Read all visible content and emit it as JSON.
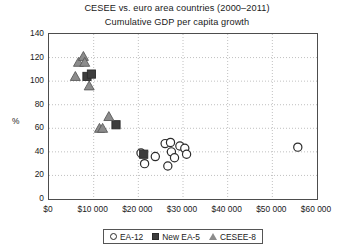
{
  "chart_data": {
    "type": "scatter",
    "title": "CESEE vs. euro area countries (2000–2011)",
    "subtitle": "Cumulative GDP per capita growth",
    "xlabel": "",
    "ylabel": "%",
    "xlim": [
      0,
      60000
    ],
    "ylim": [
      0,
      140
    ],
    "xticks": [
      0,
      10000,
      20000,
      30000,
      40000,
      50000,
      60000
    ],
    "xticklabels": [
      "$0",
      "$10 000",
      "$20 000",
      "$30 000",
      "$40 000",
      "$50 000",
      "$60 000"
    ],
    "yticks": [
      0,
      20,
      40,
      60,
      80,
      100,
      120,
      140
    ],
    "yticklabels": [
      "0",
      "20",
      "40",
      "60",
      "80",
      "100",
      "120",
      "140"
    ],
    "grid": "dotted-both-axes",
    "legend_position": "bottom-center",
    "series": [
      {
        "name": "EA-12",
        "marker": "open-circle",
        "color": "#ffffff",
        "edge_color": "#2b2b2b",
        "points": [
          {
            "x": 20600,
            "y": 39
          },
          {
            "x": 21400,
            "y": 30
          },
          {
            "x": 23800,
            "y": 36
          },
          {
            "x": 26000,
            "y": 47
          },
          {
            "x": 26600,
            "y": 28
          },
          {
            "x": 27200,
            "y": 48
          },
          {
            "x": 27400,
            "y": 40
          },
          {
            "x": 28100,
            "y": 35
          },
          {
            "x": 29300,
            "y": 45
          },
          {
            "x": 30400,
            "y": 43
          },
          {
            "x": 30800,
            "y": 38
          },
          {
            "x": 55700,
            "y": 44
          }
        ]
      },
      {
        "name": "New EA-5",
        "marker": "filled-square",
        "color": "#3d3d3d",
        "edge_color": "#2b2b2b",
        "points": [
          {
            "x": 8500,
            "y": 104
          },
          {
            "x": 9500,
            "y": 106
          },
          {
            "x": 15000,
            "y": 63
          },
          {
            "x": 21200,
            "y": 38
          }
        ]
      },
      {
        "name": "CESEE-8",
        "marker": "open-triangle",
        "color": "#8c8c8c",
        "edge_color": "#5a5a5a",
        "points": [
          {
            "x": 6600,
            "y": 116
          },
          {
            "x": 7700,
            "y": 121
          },
          {
            "x": 8000,
            "y": 116
          },
          {
            "x": 5900,
            "y": 104
          },
          {
            "x": 9000,
            "y": 96
          },
          {
            "x": 13400,
            "y": 70
          },
          {
            "x": 11300,
            "y": 60
          },
          {
            "x": 12000,
            "y": 60
          }
        ]
      }
    ]
  },
  "legend": {
    "items": [
      {
        "label": "EA-12",
        "marker": "open-circle"
      },
      {
        "label": "New EA-5",
        "marker": "filled-square"
      },
      {
        "label": "CESEE-8",
        "marker": "open-triangle"
      }
    ]
  }
}
